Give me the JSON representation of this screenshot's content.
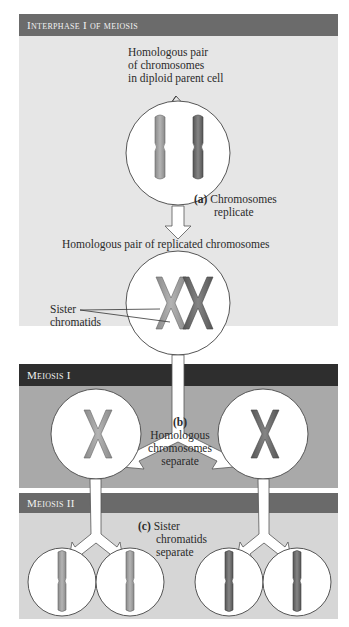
{
  "sections": {
    "interphase": {
      "title": "Interphase I of meiosis",
      "bg": "#e6e6e6",
      "header_bg": "#6b6b6b"
    },
    "meiosis1": {
      "title": "Meiosis I",
      "bg": "#a9a9a9",
      "header_bg": "#2e2e2e"
    },
    "meiosis2": {
      "title": "Meiosis II",
      "bg": "#d6d6d6",
      "header_bg": "#6a6a6a"
    }
  },
  "labels": {
    "homologous_pair": [
      "Homologous pair",
      "of chromosomes",
      "in diploid parent cell"
    ],
    "step_a_letter": "(a)",
    "step_a": [
      "Chromosomes",
      "replicate"
    ],
    "replicated_pair": "Homologous pair of replicated chromosomes",
    "sister": [
      "Sister",
      "chromatids"
    ],
    "step_b_letter": "(b)",
    "step_b": [
      "Homologous",
      "chromosomes",
      "separate"
    ],
    "step_c_letter": "(c)",
    "step_c": [
      "Sister",
      "chromatids",
      "separate"
    ]
  },
  "colors": {
    "chrom_light": "#9a9a9a",
    "chrom_dark": "#6e6e6e",
    "cell": "#ffffff",
    "outline": "#555555"
  }
}
